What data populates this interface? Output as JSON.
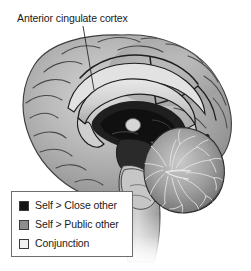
{
  "figure": {
    "background_color": "#ffffff",
    "annotation": {
      "label": "Anterior cingulate cortex",
      "leader_line": {
        "x1": 83,
        "y1": 26,
        "x2": 94,
        "y2": 90,
        "color": "#2a2a2a"
      }
    },
    "image": {
      "name": "mid-sagittal-brain-illustration",
      "description": "Grayscale mid-sagittal section of the human brain",
      "structures": [
        "cerebral cortex",
        "cingulate gyrus",
        "corpus callosum",
        "thalamus",
        "brainstem",
        "cerebellum"
      ]
    }
  },
  "legend": {
    "border_color": "#6e6e6e",
    "background_color": "#ffffff",
    "items": [
      {
        "label": "Self > Close other",
        "color": "#141414",
        "swatch_name": "swatch-self-close-other"
      },
      {
        "label": "Self > Public other",
        "color": "#8e8e8e",
        "swatch_name": "swatch-self-public-other"
      },
      {
        "label": "Conjunction",
        "color": "#f2f2f2",
        "swatch_name": "swatch-conjunction"
      }
    ]
  }
}
